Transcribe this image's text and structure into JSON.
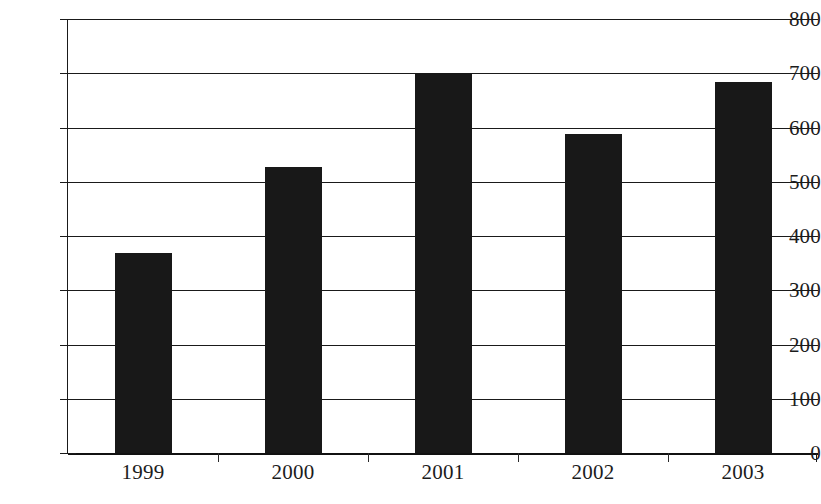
{
  "chart_data": {
    "type": "bar",
    "title": "",
    "subtitle": "",
    "xlabel": "",
    "ylabel": "",
    "categories": [
      "1999",
      "2000",
      "2001",
      "2002",
      "2003"
    ],
    "values": [
      368,
      527,
      700,
      588,
      684
    ],
    "series": [
      {
        "name": "",
        "values": [
          368,
          527,
          700,
          588,
          684
        ]
      }
    ],
    "ylim": [
      0,
      800
    ],
    "ytick_labels": [
      "0",
      "100",
      "200",
      "300",
      "400",
      "500",
      "600",
      "700",
      "800"
    ],
    "ytick_values": [
      0,
      100,
      200,
      300,
      400,
      500,
      600,
      700,
      800
    ],
    "grid": true,
    "grid_axis": "y",
    "legend": false,
    "legend_position": "none",
    "bar_color": "#181818",
    "axis_color": "#1a1a1a",
    "background_color": "#ffffff",
    "data_labels": false
  }
}
